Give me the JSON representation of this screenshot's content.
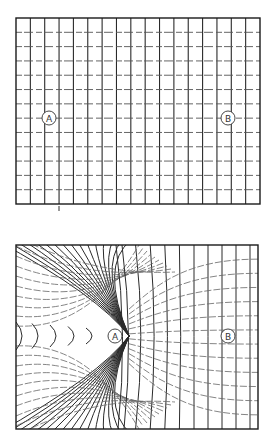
{
  "figure": {
    "panels": [
      {
        "id": "top",
        "description": "Regular undistorted grid",
        "bounds": {
          "x": 16,
          "y": 18,
          "width": 244,
          "height": 186
        },
        "columns": 17,
        "rows": 13,
        "labels": [
          {
            "text": "A",
            "x": 49,
            "y": 118
          },
          {
            "text": "B",
            "x": 228,
            "y": 118
          }
        ]
      },
      {
        "id": "bottom",
        "description": "Distorted grid converging toward point A",
        "bounds": {
          "x": 16,
          "y": 245,
          "width": 242,
          "height": 184
        },
        "convergence_point": {
          "x": 129,
          "y": 336
        },
        "labels": [
          {
            "text": "A",
            "x": 115,
            "y": 336
          },
          {
            "text": "B",
            "x": 228,
            "y": 336
          }
        ]
      }
    ],
    "colors": {
      "line": "#2a2a2a",
      "background": "#ffffff"
    }
  }
}
